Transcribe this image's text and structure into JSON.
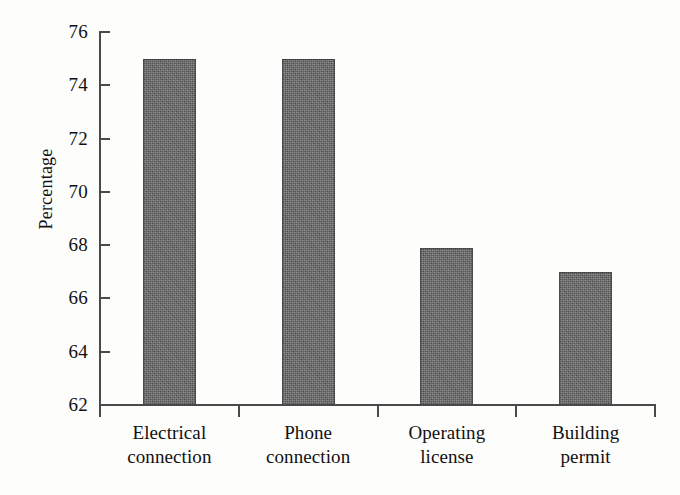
{
  "chart_data": {
    "type": "bar",
    "title": "",
    "xlabel": "",
    "ylabel": "Percentage",
    "categories": [
      "Electrical connection",
      "Phone connection",
      "Operating license",
      "Building permit"
    ],
    "category_lines": [
      [
        "Electrical",
        "connection"
      ],
      [
        "Phone",
        "connection"
      ],
      [
        "Operating",
        "license"
      ],
      [
        "Building",
        "permit"
      ]
    ],
    "values": [
      75,
      75,
      67.9,
      67
    ],
    "ylim": [
      62,
      76
    ],
    "yticks": [
      62,
      64,
      66,
      68,
      70,
      72,
      74,
      76
    ],
    "ytick_labels": [
      "62",
      "64",
      "66",
      "68",
      "70",
      "72",
      "74",
      "76"
    ],
    "grid": false,
    "legend": "none",
    "bar_color": "#585858",
    "axis_color": "#4a4a4a",
    "background_color": "#fdfdfc"
  }
}
